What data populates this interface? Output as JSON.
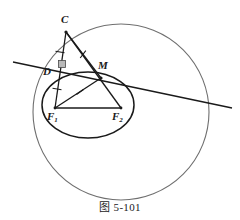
{
  "figure": {
    "caption": "图 5-101",
    "colors": {
      "outer_circle": "#6f6f6f",
      "ellipse": "#1a1a1a",
      "lines": "#1a1a1a",
      "labels": "#1a1a1a",
      "background": "#ffffff",
      "right_angle_fill": "#b9b9b9"
    },
    "points": [
      {
        "id": "C",
        "label": "C",
        "sub": "",
        "x": 66,
        "y": 32,
        "label_x": 61,
        "label_y": 18
      },
      {
        "id": "D",
        "label": "D",
        "sub": "",
        "x": 57,
        "y": 73,
        "label_x": 45,
        "label_y": 72
      },
      {
        "id": "M",
        "label": "M",
        "sub": "",
        "x": 101,
        "y": 78,
        "label_x": 99,
        "label_y": 64
      },
      {
        "id": "F1",
        "label": "F",
        "sub": "1",
        "x": 55,
        "y": 108,
        "label_x": 48,
        "label_y": 113
      },
      {
        "id": "F2",
        "label": "F",
        "sub": "2",
        "x": 121,
        "y": 108,
        "label_x": 112,
        "label_y": 113
      }
    ],
    "outer_circle": {
      "cx": 121,
      "cy": 112,
      "r": 88,
      "stroke_width": 1.1
    },
    "ellipse": {
      "cx": 88,
      "cy": 105,
      "rx": 46,
      "ry": 33,
      "rotation": 0,
      "stroke_width": 1.5
    },
    "segments": [
      {
        "name": "C-D",
        "x1": 66,
        "y1": 32,
        "x2": 55,
        "y2": 108,
        "ticks": 1
      },
      {
        "name": "C-M",
        "x1": 66,
        "y1": 32,
        "x2": 101,
        "y2": 78,
        "ticks": 1
      },
      {
        "name": "F1-M",
        "x1": 55,
        "y1": 108,
        "x2": 101,
        "y2": 78,
        "ticks": 1
      },
      {
        "name": "F1-F2",
        "x1": 55,
        "y1": 108,
        "x2": 121,
        "y2": 108,
        "ticks": 0
      },
      {
        "name": "F2-M",
        "x1": 121,
        "y1": 108,
        "x2": 101,
        "y2": 78,
        "ticks": 0
      },
      {
        "name": "C-F2",
        "x1": 66,
        "y1": 32,
        "x2": 121,
        "y2": 108,
        "ticks": 0
      }
    ],
    "tangent_line": {
      "x1": 13,
      "y1": 62,
      "x2": 232,
      "y2": 108,
      "name": "tangent-through-D-M"
    },
    "right_angle_marker": {
      "at": "D",
      "x": 59,
      "y": 61,
      "size": 7
    },
    "tick_marks": [
      {
        "on": "C-D",
        "x": 60,
        "y": 52,
        "angle": 8
      },
      {
        "on": "C-M",
        "x": 83,
        "y": 54,
        "angle": 52
      },
      {
        "on": "F1-D",
        "x": 57,
        "y": 89,
        "angle": 8
      },
      {
        "on": "F1-M",
        "x": 80,
        "y": 92,
        "angle": -33
      }
    ]
  }
}
